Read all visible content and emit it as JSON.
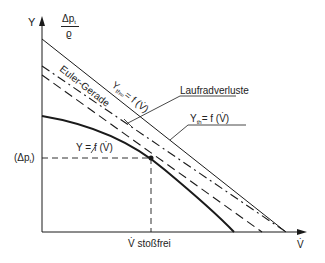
{
  "axes": {
    "y_label": "Y",
    "y_label_alt_num": "Δp",
    "y_label_alt_num_sub": "t",
    "y_label_alt_den": "ϱ",
    "x_label": "V̇",
    "x_marker_label": "V̇ stoßfrei",
    "y_marker_label": "(Δp",
    "y_marker_label_sub": "t",
    "y_marker_label_end": ")"
  },
  "curves": {
    "euler": "Euler-Gerade",
    "yth_inf": "Y",
    "yth_inf_sub": "th∞",
    "yth_inf_rest": "= f (V̇)",
    "laufrad": "Laufradverluste",
    "yth": "Y",
    "yth_sub": "th",
    "yth_rest": "= f (V̇)",
    "y": "Y = f (V̇)"
  },
  "colors": {
    "line": "#1a1a1a",
    "background": "#ffffff"
  }
}
